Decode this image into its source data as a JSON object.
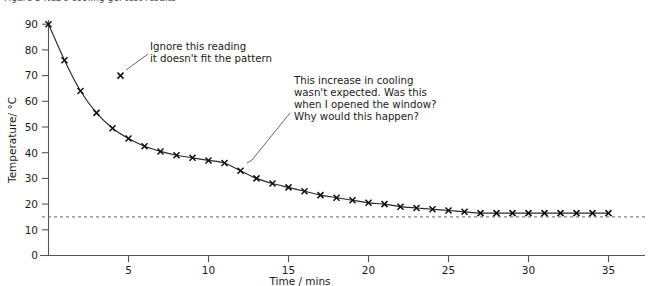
{
  "figure": {
    "caption": "Figure 5  Naz's cooling gel test results",
    "background_color": "#ffffff",
    "ink_color": "#1a1a1a"
  },
  "chart_data": {
    "type": "line",
    "title": "Figure 5  Naz's cooling gel test results",
    "xlabel": "Time / mins",
    "ylabel": "Temperature/ °C",
    "xlim": [
      0,
      37
    ],
    "ylim": [
      0,
      92
    ],
    "xticks": [
      5,
      10,
      15,
      20,
      25,
      30,
      35
    ],
    "xtick_labels": [
      "5",
      "10",
      "15",
      "20",
      "25",
      "30",
      "35"
    ],
    "yticks": [
      0,
      10,
      20,
      30,
      40,
      50,
      60,
      70,
      80,
      90
    ],
    "ytick_labels": [
      "0",
      "10",
      "20",
      "30",
      "40",
      "50",
      "60",
      "70",
      "80",
      "90"
    ],
    "grid": false,
    "legend": null,
    "series": [
      {
        "name": "Temperature of cooling gel",
        "marker": "x",
        "line": true,
        "x": [
          0,
          1,
          2,
          3,
          4,
          5,
          6,
          7,
          8,
          9,
          10,
          11,
          12,
          13,
          14,
          15,
          16,
          17,
          18,
          19,
          20,
          21,
          22,
          23,
          24,
          25,
          26,
          27,
          28,
          29,
          30,
          31,
          32,
          33,
          34,
          35
        ],
        "y": [
          90,
          76,
          64,
          55.5,
          49.5,
          45.5,
          42.5,
          40.5,
          39,
          38,
          37,
          36,
          33,
          30,
          28,
          26.5,
          25,
          23.5,
          22.5,
          21.5,
          20.5,
          20,
          19,
          18.5,
          18,
          17.5,
          17,
          16.5,
          16.5,
          16.5,
          16.5,
          16.5,
          16.5,
          16.5,
          16.5,
          16.5
        ]
      },
      {
        "name": "Anomalous reading",
        "marker": "x",
        "line": false,
        "x": [
          4.5
        ],
        "y": [
          70
        ]
      }
    ],
    "reference_lines": [
      {
        "name": "room-temperature-line",
        "orientation": "horizontal",
        "value": 15,
        "style": "dashed"
      }
    ],
    "annotations": [
      {
        "id": "outlier-note",
        "lines": [
          "Ignore this reading",
          "it doesn't fit the pattern"
        ],
        "points_to_x": 4.5,
        "points_to_y": 70
      },
      {
        "id": "cooling-increase-note",
        "lines": [
          "This increase in cooling",
          "wasn't expected. Was this",
          "when I opened the window?",
          "Why would this happen?"
        ],
        "points_to_x": 12.5,
        "points_to_y": 33
      }
    ]
  }
}
